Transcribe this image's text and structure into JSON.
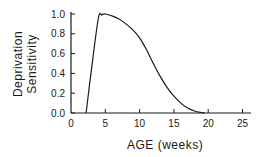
{
  "chart_data": {
    "type": "line",
    "title": "",
    "xlabel": "AGE (weeks)",
    "ylabel_line1": "Deprivation",
    "ylabel_line2": "Sensitivity",
    "xlim": [
      0,
      26
    ],
    "ylim": [
      0,
      1.0
    ],
    "x_ticks": [
      "0",
      "5",
      "10",
      "15",
      "20",
      "25"
    ],
    "y_ticks": [
      "0.0",
      "0.2",
      "0.4",
      "0.6",
      "0.8",
      "1.0"
    ],
    "grid": false,
    "legend": null,
    "series": [
      {
        "name": "Deprivation Sensitivity",
        "x": [
          2.2,
          3.0,
          4.0,
          4.5,
          5.0,
          6.0,
          7.0,
          8.0,
          9.0,
          10.0,
          11.0,
          12.0,
          13.0,
          14.0,
          15.0,
          16.0,
          17.0,
          18.0,
          19.0,
          19.5
        ],
        "values": [
          0.0,
          0.45,
          0.96,
          0.99,
          1.0,
          0.98,
          0.95,
          0.9,
          0.84,
          0.76,
          0.64,
          0.5,
          0.37,
          0.26,
          0.17,
          0.1,
          0.05,
          0.02,
          0.005,
          0.0
        ]
      }
    ]
  }
}
